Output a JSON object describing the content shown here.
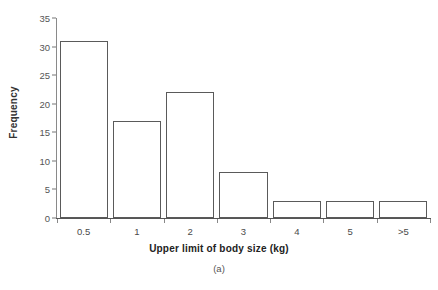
{
  "chart_data": {
    "type": "bar",
    "title": "",
    "subtitle": "",
    "caption": "(a)",
    "xlabel": "Upper limit of body size (kg)",
    "ylabel": "Frequency",
    "categories": [
      "0.5",
      "1",
      "2",
      "3",
      "4",
      "5",
      ">5"
    ],
    "values": [
      31,
      17,
      22,
      8,
      3,
      3,
      3
    ],
    "series": [
      {
        "name": "Frequency",
        "values": [
          31,
          17,
          22,
          8,
          3,
          3,
          3
        ]
      }
    ],
    "ylim": [
      0,
      35
    ],
    "y_ticks": [
      0,
      5,
      10,
      15,
      20,
      25,
      30,
      35
    ],
    "y_tick_labels": [
      "0",
      "5",
      "10",
      "15",
      "20",
      "25",
      "30",
      "35"
    ],
    "x_tick_labels": [
      "0.5",
      "1",
      "2",
      "3",
      "4",
      "5",
      ">5"
    ],
    "grid": false,
    "legend": false,
    "legend_position": "none",
    "bar_fill_color": "#ffffff",
    "bar_edge_color": "#5a5a5a",
    "axis_color": "#555555",
    "text_color": "#333333",
    "background_color": "#ffffff"
  }
}
